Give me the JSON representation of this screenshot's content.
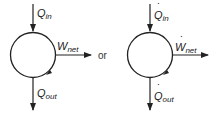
{
  "diagram": {
    "separator": "or",
    "left": {
      "notation": "energy",
      "heat_in": {
        "symbol": "Q",
        "sub": "in",
        "dot": ""
      },
      "work_net": {
        "symbol": "W",
        "sub": "net",
        "dot": ""
      },
      "heat_out": {
        "symbol": "Q",
        "sub": "out",
        "dot": ""
      }
    },
    "right": {
      "notation": "rate",
      "heat_in": {
        "symbol": "Q",
        "sub": "in",
        "dot": "˙"
      },
      "work_net": {
        "symbol": "W",
        "sub": "net",
        "dot": "˙"
      },
      "heat_out": {
        "symbol": "Q",
        "sub": "out",
        "dot": "˙"
      }
    },
    "colors": {
      "stroke": "#222222",
      "background": "#ffffff"
    }
  }
}
